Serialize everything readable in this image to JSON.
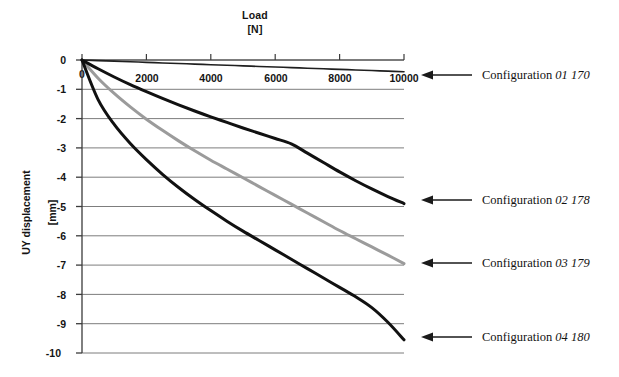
{
  "chart_data": {
    "type": "line",
    "title": "Load\n[N]",
    "xlabel": "Load [N]",
    "ylabel": "UY displacement [mm]",
    "xlabel_line1": "Load",
    "xlabel_line2": "[N]",
    "ylabel_line1": "UY displacement",
    "ylabel_line2": "[mm]",
    "xlim": [
      0,
      10000
    ],
    "ylim": [
      -10,
      0
    ],
    "xticks": [
      "0",
      "2000",
      "4000",
      "6000",
      "8000",
      "10000"
    ],
    "xtick_values": [
      0,
      2000,
      4000,
      6000,
      8000,
      10000
    ],
    "yticks": [
      "0",
      "-1",
      "-2",
      "-3",
      "-4",
      "-5",
      "-6",
      "-7",
      "-8",
      "-9",
      "-10"
    ],
    "ytick_values": [
      0,
      -1,
      -2,
      -3,
      -4,
      -5,
      -6,
      -7,
      -8,
      -9,
      -10
    ],
    "grid": "horizontal",
    "legend_position": "right-callouts",
    "x": [
      0,
      500,
      1000,
      1500,
      2000,
      2500,
      3000,
      3500,
      4000,
      4500,
      5000,
      5500,
      6000,
      6500,
      7000,
      7500,
      8000,
      8500,
      9000,
      9500,
      10000
    ],
    "series": [
      {
        "name": "Configuration 01 170",
        "label_prefix": "Configuration",
        "label_code": "01 170",
        "color": "#1f1f1f",
        "width": 1.6,
        "values": [
          0,
          -0.02,
          -0.04,
          -0.06,
          -0.08,
          -0.1,
          -0.12,
          -0.14,
          -0.16,
          -0.18,
          -0.2,
          -0.22,
          -0.24,
          -0.26,
          -0.28,
          -0.3,
          -0.32,
          -0.34,
          -0.36,
          -0.38,
          -0.4
        ]
      },
      {
        "name": "Configuration 02 178",
        "label_prefix": "Configuration",
        "label_code": "02 178",
        "color": "#111111",
        "width": 3.0,
        "values": [
          0,
          -0.3,
          -0.58,
          -0.84,
          -1.08,
          -1.31,
          -1.53,
          -1.74,
          -1.94,
          -2.13,
          -2.32,
          -2.5,
          -2.68,
          -2.86,
          -3.18,
          -3.5,
          -3.82,
          -4.12,
          -4.4,
          -4.66,
          -4.9
        ]
      },
      {
        "name": "Configuration 03 179",
        "label_prefix": "Configuration",
        "label_code": "03 179",
        "color": "#9b9b9b",
        "width": 3.0,
        "values": [
          0,
          -0.62,
          -1.14,
          -1.6,
          -2.02,
          -2.4,
          -2.76,
          -3.1,
          -3.42,
          -3.72,
          -4.02,
          -4.32,
          -4.62,
          -4.92,
          -5.22,
          -5.52,
          -5.82,
          -6.1,
          -6.38,
          -6.66,
          -6.95
        ]
      },
      {
        "name": "Configuration 04 180",
        "label_prefix": "Configuration",
        "label_code": "04 180",
        "color": "#111111",
        "width": 3.0,
        "values": [
          0,
          -1.35,
          -2.2,
          -2.85,
          -3.4,
          -3.9,
          -4.35,
          -4.76,
          -5.14,
          -5.5,
          -5.84,
          -6.16,
          -6.48,
          -6.8,
          -7.12,
          -7.44,
          -7.76,
          -8.08,
          -8.45,
          -8.95,
          -9.55
        ]
      }
    ],
    "callouts": [
      {
        "text": "Configuration 01 170",
        "prefix": "Configuration ",
        "code": "01 170"
      },
      {
        "text": "Configuration 02 178",
        "prefix": "Configuration ",
        "code": "02 178"
      },
      {
        "text": "Configuration 03 179",
        "prefix": "Configuration ",
        "code": "03 179"
      },
      {
        "text": "Configuration 04 180",
        "prefix": "Configuration ",
        "code": "04 180"
      }
    ]
  },
  "colors": {
    "background": "#ffffff",
    "axis": "#3b3b3b",
    "grid": "#6e6e6e",
    "text": "#141414",
    "arrow": "#1a1a1a"
  }
}
